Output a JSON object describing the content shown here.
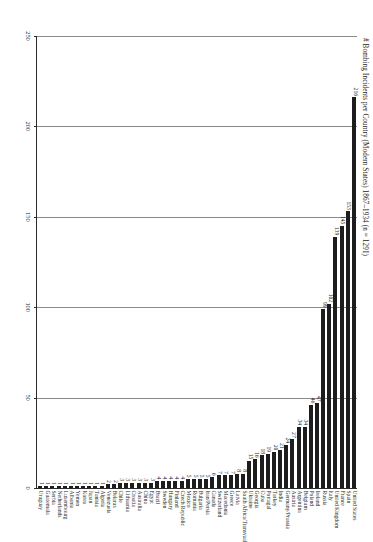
{
  "chart_data": {
    "type": "bar",
    "orientation": "horizontal",
    "title": "# Bombing Incidents per Country (Modern States) 1867–1934 (n = 1291)",
    "xlabel": "",
    "ylabel": "",
    "xlim": [
      0,
      250
    ],
    "xticks": [
      0,
      50,
      100,
      150,
      200,
      250
    ],
    "xtick_labels": [
      "0",
      "50",
      "100",
      "150",
      "200",
      "250"
    ],
    "grid": true,
    "legend": false,
    "bar_color": "#1d1d1d",
    "note": "Chart is printed rotated 90 degrees on the page; value axis increases right-to-left.",
    "categories": [
      "United States",
      "Spain",
      "France",
      "United Kingdom",
      "Italy",
      "Russia",
      "Ireland",
      "Poland",
      "Belgium",
      "Argentina",
      "Austria",
      "Germany/Prussia",
      "India",
      "Turkey",
      "Portugal",
      "Cuba",
      "Georgia",
      "Ukraine",
      "South Africa/Transvaal",
      "Latvia",
      "Greece",
      "Macedonia",
      "Switzerland",
      "Canada",
      "Iran/Persia",
      "Bulgaria",
      "Romania",
      "Mexico",
      "Czech Republic",
      "Finland",
      "Hungary",
      "Sweden",
      "Brazil",
      "Egypt",
      "China",
      "Australia",
      "Croatia",
      "Lithuania",
      "Chile",
      "Belarus",
      "Venezuela",
      "Algeria",
      "Tunisia",
      "Japan",
      "Korea",
      "Yemen",
      "Albania",
      "Luxembourg",
      "Netherlands",
      "Serbia",
      "Guatemala",
      "Uruguay"
    ],
    "values": [
      216,
      153,
      145,
      139,
      102,
      99,
      47,
      46,
      34,
      34,
      27,
      24,
      21,
      20,
      19,
      18,
      16,
      15,
      8,
      8,
      7,
      7,
      7,
      6,
      5,
      5,
      5,
      5,
      4,
      4,
      4,
      4,
      4,
      3,
      3,
      3,
      3,
      3,
      3,
      2,
      2,
      1,
      1,
      1,
      1,
      1,
      1,
      1,
      1,
      1,
      1,
      1
    ]
  }
}
